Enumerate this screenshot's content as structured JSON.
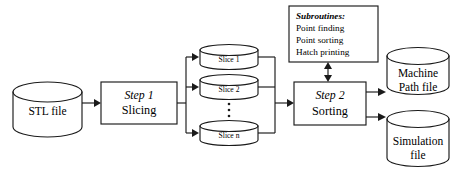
{
  "diagram": {
    "type": "process-flowchart",
    "colors": {
      "stroke": "#1a1a1a",
      "fill": "#ffffff",
      "text": "#000000",
      "background": "#ffffff"
    },
    "nodes": {
      "stl_file": {
        "label": "STL file",
        "shape": "cylinder"
      },
      "step1": {
        "label_italic": "Step 1",
        "label_plain": "Slicing",
        "shape": "rectangle"
      },
      "step2": {
        "label_italic": "Step 2",
        "label_plain": "Sorting",
        "shape": "rectangle"
      },
      "machine_path_file": {
        "line1": "Machine",
        "line2": "Path file",
        "shape": "cylinder"
      },
      "simulation_file": {
        "line1": "Simulation",
        "line2": "file",
        "shape": "cylinder"
      }
    },
    "slices": [
      {
        "label": "Slice 1",
        "shape": "cylinder"
      },
      {
        "label": "Slice 2",
        "shape": "cylinder"
      },
      {
        "label": "Slice n",
        "shape": "cylinder"
      }
    ],
    "slice_ellipsis": "⋮",
    "subroutines": {
      "heading": "Subroutines:",
      "items": [
        "Point finding",
        "Point sorting",
        "Hatch printing"
      ],
      "shape": "rectangle"
    },
    "connections": [
      {
        "from": "stl_file",
        "to": "step1",
        "arrow": "single"
      },
      {
        "from": "step1",
        "to": "slices",
        "arrow": "single-fanout"
      },
      {
        "from": "slices",
        "to": "step2",
        "arrow": "single-fanin"
      },
      {
        "from": "subroutines",
        "to": "step2",
        "arrow": "double"
      },
      {
        "from": "step2",
        "to": "machine_path_file",
        "arrow": "single"
      },
      {
        "from": "step2",
        "to": "simulation_file",
        "arrow": "single"
      }
    ]
  }
}
